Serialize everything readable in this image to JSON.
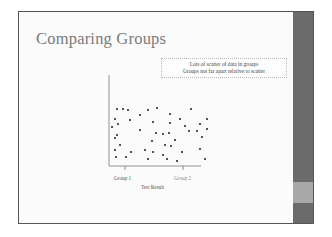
{
  "slide": {
    "title": "Comparing Groups",
    "note_lines": [
      "Lots of scatter of data in groups",
      "Groups not far apart relative to scatter"
    ],
    "colors": {
      "title": "#7a7a7a",
      "sidebar": "#6b6b6b",
      "sidebar_band": "#a8a8a8",
      "dots": "#333333"
    }
  },
  "chart_data": {
    "type": "scatter",
    "title": "",
    "xlabel": "Test Result",
    "ylabel": "",
    "categories": [
      "Group 1",
      "Group 2"
    ],
    "x_ticks": [
      "Group 1",
      "Group 2"
    ],
    "grid": false,
    "legend": null,
    "note": "Points scattered across both groups; axis values not labeled. Coordinates are pixel positions within the plot.",
    "points": [
      [
        115,
        107
      ],
      [
        121,
        107
      ],
      [
        126,
        108
      ],
      [
        146,
        108
      ],
      [
        155,
        106
      ],
      [
        189,
        107
      ],
      [
        138,
        113
      ],
      [
        168,
        112
      ],
      [
        113,
        117
      ],
      [
        116,
        122
      ],
      [
        128,
        118
      ],
      [
        151,
        120
      ],
      [
        168,
        121
      ],
      [
        178,
        117
      ],
      [
        198,
        122
      ],
      [
        205,
        117
      ],
      [
        110,
        125
      ],
      [
        138,
        128
      ],
      [
        183,
        124
      ],
      [
        187,
        129
      ],
      [
        195,
        129
      ],
      [
        205,
        127
      ],
      [
        113,
        136
      ],
      [
        115,
        133
      ],
      [
        154,
        131
      ],
      [
        161,
        132
      ],
      [
        167,
        131
      ],
      [
        200,
        135
      ],
      [
        173,
        138
      ],
      [
        150,
        139
      ],
      [
        118,
        143
      ],
      [
        163,
        143
      ],
      [
        169,
        144
      ],
      [
        113,
        148
      ],
      [
        143,
        148
      ],
      [
        198,
        147
      ],
      [
        129,
        150
      ],
      [
        151,
        150
      ],
      [
        180,
        150
      ],
      [
        114,
        155
      ],
      [
        124,
        155
      ],
      [
        161,
        153
      ],
      [
        146,
        157
      ],
      [
        165,
        157
      ],
      [
        203,
        157
      ],
      [
        175,
        159
      ]
    ]
  }
}
